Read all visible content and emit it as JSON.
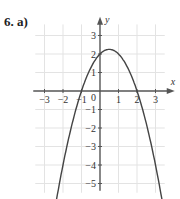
{
  "problem_label": "6.  a)",
  "chart_data": {
    "type": "line",
    "title": "",
    "function": "y = -x^2 + x + 2",
    "xlabel": "x",
    "ylabel": "y",
    "xlim": [
      -3.5,
      3.5
    ],
    "ylim": [
      -5.5,
      3.8
    ],
    "grid": true,
    "x_ticks": [
      -3,
      -2,
      -1,
      1,
      2,
      3
    ],
    "y_ticks": [
      -5,
      -4,
      -3,
      -2,
      -1,
      1,
      2,
      3
    ],
    "origin_label": "0",
    "series": [
      {
        "name": "parabola",
        "x": [
          -2.35,
          -2,
          -1.5,
          -1,
          -0.5,
          0,
          0.5,
          1,
          1.5,
          2,
          2.5,
          3,
          3.35
        ],
        "y": [
          -5.87,
          -4,
          -1.75,
          0,
          1.25,
          2,
          2.25,
          2,
          1.25,
          0,
          -1.75,
          -4,
          -5.87
        ]
      }
    ],
    "key_points": {
      "vertex": [
        0.5,
        2.25
      ],
      "roots": [
        -1,
        2
      ],
      "y_intercept": 2
    }
  }
}
